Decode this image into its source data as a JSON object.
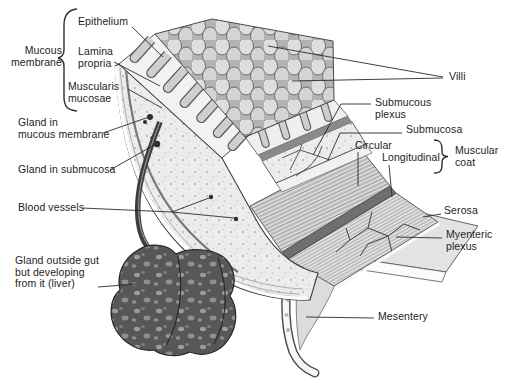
{
  "figure": {
    "colors": {
      "background": "#ffffff",
      "ink": "#1d1d1d",
      "leader_line": "#2b2b2b",
      "light_gray": "#ececec",
      "mid_gray": "#b3b3b3",
      "dark_gray": "#6f6f6f",
      "liver_dark": "#575757",
      "serosa_white": "#fbfbfb"
    },
    "labels": {
      "epithelium": "Epithelium",
      "mucous_membrane": "Mucous\nmembrane",
      "lamina_propria": "Lamina\npropria",
      "muscularis_mucosae": "Muscularis\nmucosae",
      "gland_in_mucous_membrane": "Gland in\nmucous membrane",
      "gland_in_submucosa": "Gland in submucosa",
      "blood_vessels": "Blood vessels",
      "gland_outside_gut": "Gland outside gut\nbut developing\nfrom it (liver)",
      "villi": "Villi",
      "submucous_plexus": "Submucous\nplexus",
      "submucosa": "Submucosa",
      "circular": "Circular",
      "longitudinal": "Longitudinal",
      "muscular_coat": "Muscular\ncoat",
      "serosa": "Serosa",
      "myenteric_plexus": "Myenteric\nplexus",
      "mesentery": "Mesentery"
    }
  }
}
